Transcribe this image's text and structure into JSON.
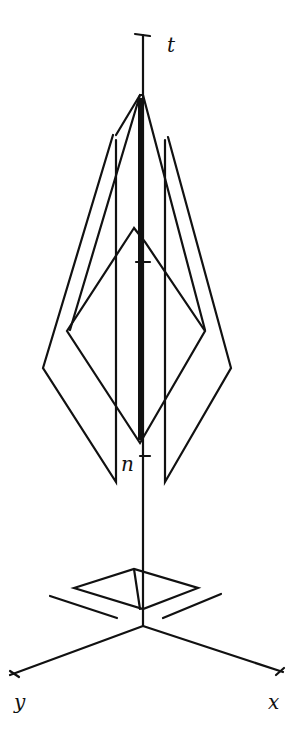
{
  "diagram": {
    "axes": {
      "t": "t",
      "x": "x",
      "y": "y"
    },
    "markers": {
      "n": "n"
    },
    "colors": {
      "stroke": "#111111",
      "background": "#ffffff"
    }
  }
}
